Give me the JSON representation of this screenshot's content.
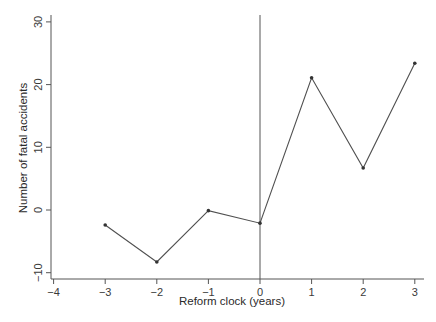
{
  "chart_data": {
    "type": "line",
    "title": "",
    "xlabel": "Reform clock (years)",
    "ylabel": "Number of fatal accidents",
    "x": [
      -3,
      -2,
      -1,
      0,
      1,
      2,
      3
    ],
    "series": [
      {
        "name": "Fatal accidents",
        "values": [
          -2.4,
          -8.3,
          -0.1,
          -2.1,
          21.1,
          6.7,
          23.4
        ]
      }
    ],
    "xlim": [
      -4,
      3
    ],
    "ylim": [
      -10,
      30
    ],
    "x_ticks": [
      -4,
      -3,
      -2,
      -1,
      0,
      1,
      2,
      3
    ],
    "x_tick_labels": [
      "−4",
      "−3",
      "−2",
      "−1",
      "0",
      "1",
      "2",
      "3"
    ],
    "y_ticks": [
      -10,
      0,
      10,
      20,
      30
    ],
    "y_tick_labels": [
      "−10",
      "0",
      "10",
      "20",
      "30"
    ],
    "reference_lines": [
      {
        "orientation": "vertical",
        "x": 0
      }
    ],
    "grid": false,
    "legend": "none",
    "colors": {
      "line": "#505050",
      "marker": "#333333",
      "axis": "#555555",
      "reference_line": "#555555"
    }
  }
}
